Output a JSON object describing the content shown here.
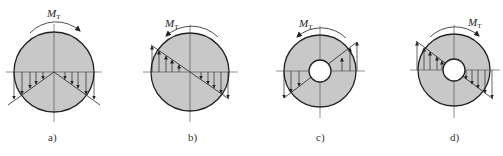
{
  "figure": {
    "colors": {
      "fill": "#c8c8c8",
      "stroke": "#222222",
      "axis": "#444444",
      "background": "#ffffff"
    },
    "moment_symbol": "M",
    "moment_subscript": "T",
    "panels": [
      {
        "id": "a",
        "caption": "a)",
        "section": "solid",
        "moment_direction": "clockwise",
        "stress_distribution": "V-shaped, downward arrows both sides"
      },
      {
        "id": "b",
        "caption": "b)",
        "section": "solid",
        "moment_direction": "counter-clockwise",
        "stress_distribution": "linear, up on left, down on right"
      },
      {
        "id": "c",
        "caption": "c)",
        "section": "hollow",
        "moment_direction": "counter-clockwise",
        "stress_distribution": "linear, down on left, up on right"
      },
      {
        "id": "d",
        "caption": "d)",
        "section": "hollow",
        "moment_direction": "clockwise",
        "stress_distribution": "linear, up on left, down on right"
      }
    ]
  }
}
